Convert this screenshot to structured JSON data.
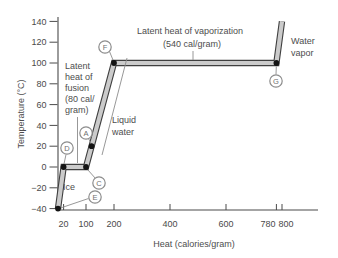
{
  "figure": {
    "y_axis": {
      "title": "Temperature (°C)",
      "ticks": [
        140,
        120,
        100,
        80,
        60,
        40,
        20,
        0,
        -20,
        -40
      ]
    },
    "x_axis": {
      "title": "Heat (calories/gram)",
      "ticks": [
        20,
        100,
        200,
        400,
        600,
        780,
        800
      ]
    },
    "annotations": {
      "vaporization_line1": "Latent heat of vaporization",
      "vaporization_line2": "(540 cal/gram)",
      "fusion_lines": [
        "Latent",
        "heat of",
        "fusion",
        "(80 cal/",
        "gram)"
      ],
      "water_vapor_line1": "Water",
      "water_vapor_line2": "vapor",
      "liquid_line1": "Liquid",
      "liquid_line2": "water",
      "ice": "Ice"
    },
    "point_labels": {
      "A": "A",
      "C": "C",
      "D": "D",
      "E": "E",
      "F": "F",
      "G": "G"
    }
  },
  "colors": {
    "curve_edge": "#3f3f3f",
    "curve_fill": "#cbcbcb",
    "dot": "#141414",
    "axis": "#4a4a4a"
  },
  "chart_data": {
    "type": "line",
    "xlabel": "Heat (calories/gram)",
    "ylabel": "Temperature (°C)",
    "xlim": [
      0,
      930
    ],
    "ylim": [
      -40,
      140
    ],
    "x_ticks": [
      20,
      100,
      200,
      400,
      600,
      780,
      800
    ],
    "y_ticks": [
      140,
      120,
      100,
      80,
      60,
      40,
      20,
      0,
      -20,
      -40
    ],
    "curve_points": [
      [
        0,
        -40
      ],
      [
        20,
        0
      ],
      [
        100,
        0
      ],
      [
        200,
        100
      ],
      [
        780,
        100
      ],
      [
        800,
        140
      ]
    ],
    "marked_points": {
      "A": [
        120,
        20
      ],
      "C": [
        100,
        0
      ],
      "D": [
        20,
        0
      ],
      "E": [
        0,
        -40
      ],
      "F": [
        200,
        100
      ],
      "G": [
        780,
        100
      ]
    },
    "segments": [
      {
        "phase": "Ice warming",
        "from": [
          0,
          -40
        ],
        "to": [
          20,
          0
        ]
      },
      {
        "phase": "Melting (latent heat of fusion)",
        "from": [
          20,
          0
        ],
        "to": [
          100,
          0
        ]
      },
      {
        "phase": "Liquid water warming",
        "from": [
          100,
          0
        ],
        "to": [
          200,
          100
        ]
      },
      {
        "phase": "Boiling (latent heat of vaporization)",
        "from": [
          200,
          100
        ],
        "to": [
          780,
          100
        ]
      },
      {
        "phase": "Water vapor warming",
        "from": [
          780,
          100
        ],
        "to": [
          800,
          140
        ]
      }
    ],
    "latent_heats": {
      "fusion_cal_per_gram": 80,
      "vaporization_cal_per_gram": 540
    }
  }
}
